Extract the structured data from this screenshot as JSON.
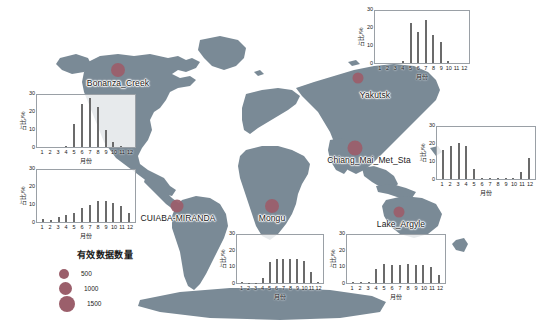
{
  "figure": {
    "land_color": "#7a8a96",
    "ocean_color": "#ffffff",
    "dot_color": "#9b5f6b",
    "bar_color": "#6b6b6b"
  },
  "legend": {
    "title": "有效数据数量",
    "items": [
      {
        "label": "500",
        "size": 5
      },
      {
        "label": "1000",
        "size": 6.5
      },
      {
        "label": "1500",
        "size": 8
      }
    ]
  },
  "stations": [
    {
      "name": "Bonanza_Creek",
      "label_x": 118,
      "label_y": 78,
      "dot_x": 118,
      "dot_y": 70,
      "dot_size": 7
    },
    {
      "name": "Yakutsk",
      "label_x": 375,
      "label_y": 90,
      "dot_x": 358,
      "dot_y": 78,
      "dot_size": 5.5
    },
    {
      "name": "Chiang_Mai_Met_Sta",
      "label_x": 369,
      "label_y": 155,
      "dot_x": 355,
      "dot_y": 148,
      "dot_size": 7.5
    },
    {
      "name": "CUIABA-MIRANDA",
      "label_x": 178,
      "label_y": 213,
      "dot_x": 177,
      "dot_y": 206,
      "dot_size": 6.5
    },
    {
      "name": "Mongu",
      "label_x": 272,
      "label_y": 213,
      "dot_x": 272,
      "dot_y": 206,
      "dot_size": 7
    },
    {
      "name": "Lake_Argyle",
      "label_x": 401,
      "label_y": 219,
      "dot_x": 399,
      "dot_y": 212,
      "dot_size": 5.5
    }
  ],
  "chart_data": [
    {
      "id": "bonanza_creek",
      "type": "bar",
      "title": "Bonanza_Creek",
      "xlabel": "月份",
      "ylabel": "占比/%",
      "categories": [
        "1",
        "2",
        "3",
        "4",
        "5",
        "6",
        "7",
        "8",
        "9",
        "10",
        "11",
        "12"
      ],
      "values": [
        0,
        0,
        0,
        0.4,
        13,
        25,
        28,
        23,
        10,
        3,
        0.5,
        0
      ],
      "ylim": [
        0,
        30
      ],
      "yticks": [
        0,
        10,
        20,
        30
      ],
      "grid": false
    },
    {
      "id": "yakutsk",
      "type": "bar",
      "title": "Yakutsk",
      "xlabel": "月份",
      "ylabel": "占比/%",
      "categories": [
        "1",
        "2",
        "3",
        "4",
        "5",
        "6",
        "7",
        "8",
        "9",
        "10",
        "11",
        "12"
      ],
      "values": [
        0,
        0,
        0,
        1,
        23,
        18,
        25,
        16,
        12,
        1,
        0,
        0
      ],
      "ylim": [
        0,
        30
      ],
      "yticks": [
        0,
        10,
        20,
        30
      ],
      "grid": false
    },
    {
      "id": "cuiaba_miranda",
      "type": "bar",
      "title": "CUIABA-MIRANDA",
      "xlabel": "月份",
      "ylabel": "占比/%",
      "categories": [
        "1",
        "2",
        "3",
        "4",
        "5",
        "6",
        "7",
        "8",
        "9",
        "10",
        "11",
        "12"
      ],
      "values": [
        2,
        1,
        3,
        4,
        5,
        8,
        10,
        12,
        12,
        11,
        9,
        5
      ],
      "ylim": [
        0,
        30
      ],
      "yticks": [
        0,
        10,
        20,
        30
      ],
      "grid": false
    },
    {
      "id": "chiang_mai_met_sta",
      "type": "bar",
      "title": "Chiang_Mai_Met_Sta",
      "xlabel": "月份",
      "ylabel": "占比/%",
      "categories": [
        "1",
        "2",
        "3",
        "4",
        "5",
        "6",
        "7",
        "8",
        "9",
        "10",
        "11",
        "12"
      ],
      "values": [
        17,
        19,
        21,
        19,
        6,
        0.6,
        0.4,
        0.4,
        0.4,
        0.6,
        4,
        12
      ],
      "ylim": [
        0,
        30
      ],
      "yticks": [
        0,
        10,
        20,
        30
      ],
      "grid": false
    },
    {
      "id": "mongu",
      "type": "bar",
      "title": "Mongu",
      "xlabel": "月份",
      "ylabel": "占比/%",
      "categories": [
        "1",
        "2",
        "3",
        "4",
        "5",
        "6",
        "7",
        "8",
        "9",
        "10",
        "11",
        "12"
      ],
      "values": [
        0.4,
        0.3,
        0.3,
        3,
        13,
        15,
        15,
        15,
        15,
        14,
        7,
        0.5
      ],
      "ylim": [
        0,
        30
      ],
      "yticks": [
        0,
        10,
        20,
        30
      ],
      "grid": false
    },
    {
      "id": "lake_argyle",
      "type": "bar",
      "title": "Lake_Argyle",
      "xlabel": "月份",
      "ylabel": "占比/%",
      "categories": [
        "1",
        "2",
        "3",
        "4",
        "5",
        "6",
        "7",
        "8",
        "9",
        "10",
        "11",
        "12"
      ],
      "values": [
        0.6,
        0.5,
        0.5,
        9,
        12,
        11,
        11,
        12,
        11,
        11,
        10,
        5
      ],
      "ylim": [
        0,
        30
      ],
      "yticks": [
        0,
        10,
        20,
        30
      ],
      "grid": false
    }
  ],
  "panel_geometry": {
    "bonanza_creek": {
      "x": 14,
      "y": 92,
      "w": 122,
      "h": 72
    },
    "yakutsk": {
      "x": 352,
      "y": 8,
      "w": 118,
      "h": 72
    },
    "cuiaba_miranda": {
      "x": 14,
      "y": 167,
      "w": 122,
      "h": 72
    },
    "chiang_mai_met_sta": {
      "x": 414,
      "y": 124,
      "w": 122,
      "h": 72
    },
    "mongu": {
      "x": 214,
      "y": 232,
      "w": 110,
      "h": 68
    },
    "lake_argyle": {
      "x": 324,
      "y": 232,
      "w": 122,
      "h": 68
    }
  }
}
